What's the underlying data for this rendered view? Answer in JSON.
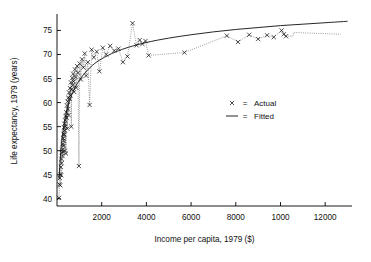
{
  "chart_data": {
    "type": "scatter",
    "title": "",
    "xlabel": "Income per capita, 1979 ($)",
    "ylabel": "Life expectancy, 1979 (years)",
    "xlim": [
      0,
      13200
    ],
    "ylim": [
      38.5,
      78.0
    ],
    "grid": false,
    "xticks": [
      2000,
      4000,
      6000,
      8000,
      10000,
      12000
    ],
    "xticklabels": [
      "2000",
      "4000",
      "6000",
      "8000",
      "1000",
      "12000"
    ],
    "yticks": [
      40,
      45,
      50,
      55,
      60,
      65,
      70,
      75
    ],
    "yticklabels": [
      "40",
      "45",
      "50",
      "55",
      "60",
      "65",
      "70",
      "75"
    ],
    "legend": {
      "position": "center-right-inside",
      "entries": [
        {
          "marker": "x",
          "separator": "=",
          "label": "Actual"
        },
        {
          "marker": "line",
          "separator": "=",
          "label": "Fitted"
        }
      ]
    },
    "series": [
      {
        "name": "Actual",
        "marker": "x",
        "color": "#111111",
        "connector": "dotted",
        "points": [
          [
            90,
            40.2
          ],
          [
            110,
            43.0
          ],
          [
            130,
            44.3
          ],
          [
            145,
            42.8
          ],
          [
            160,
            45.1
          ],
          [
            175,
            46.6
          ],
          [
            185,
            44.9
          ],
          [
            200,
            48.3
          ],
          [
            210,
            47.4
          ],
          [
            220,
            49.6
          ],
          [
            235,
            50.2
          ],
          [
            245,
            48.9
          ],
          [
            255,
            51.4
          ],
          [
            265,
            49.8
          ],
          [
            275,
            52.6
          ],
          [
            285,
            51.0
          ],
          [
            295,
            53.5
          ],
          [
            305,
            52.1
          ],
          [
            315,
            54.8
          ],
          [
            325,
            53.3
          ],
          [
            335,
            55.6
          ],
          [
            345,
            54.2
          ],
          [
            355,
            50.0
          ],
          [
            365,
            56.3
          ],
          [
            375,
            55.1
          ],
          [
            390,
            57.2
          ],
          [
            400,
            49.4
          ],
          [
            415,
            58.0
          ],
          [
            430,
            56.8
          ],
          [
            445,
            59.4
          ],
          [
            460,
            54.6
          ],
          [
            475,
            60.2
          ],
          [
            490,
            58.6
          ],
          [
            505,
            61.0
          ],
          [
            520,
            57.4
          ],
          [
            540,
            62.1
          ],
          [
            560,
            60.8
          ],
          [
            580,
            63.0
          ],
          [
            600,
            61.5
          ],
          [
            620,
            64.2
          ],
          [
            640,
            55.0
          ],
          [
            660,
            62.8
          ],
          [
            680,
            65.1
          ],
          [
            700,
            63.6
          ],
          [
            720,
            66.0
          ],
          [
            745,
            64.4
          ],
          [
            770,
            62.2
          ],
          [
            800,
            66.9
          ],
          [
            830,
            65.3
          ],
          [
            860,
            63.1
          ],
          [
            900,
            67.6
          ],
          [
            940,
            66.2
          ],
          [
            980,
            46.8
          ],
          [
            1020,
            68.1
          ],
          [
            1070,
            64.8
          ],
          [
            1120,
            69.0
          ],
          [
            1180,
            67.3
          ],
          [
            1240,
            70.2
          ],
          [
            1300,
            65.6
          ],
          [
            1380,
            68.4
          ],
          [
            1460,
            59.5
          ],
          [
            1550,
            71.0
          ],
          [
            1650,
            69.4
          ],
          [
            1780,
            70.6
          ],
          [
            1900,
            66.5
          ],
          [
            2050,
            71.4
          ],
          [
            2200,
            70.0
          ],
          [
            2380,
            71.8
          ],
          [
            2560,
            70.8
          ],
          [
            2750,
            71.2
          ],
          [
            2950,
            68.4
          ],
          [
            3150,
            69.6
          ],
          [
            3380,
            76.5
          ],
          [
            3560,
            71.9
          ],
          [
            3700,
            73.0
          ],
          [
            3820,
            72.2
          ],
          [
            3960,
            72.8
          ],
          [
            4100,
            69.8
          ],
          [
            5700,
            70.4
          ],
          [
            7600,
            73.9
          ],
          [
            8100,
            72.6
          ],
          [
            8600,
            74.1
          ],
          [
            9000,
            73.2
          ],
          [
            9400,
            74.0
          ],
          [
            9700,
            73.6
          ],
          [
            10050,
            75.0
          ],
          [
            10150,
            74.2
          ],
          [
            10250,
            73.8
          ]
        ]
      },
      {
        "name": "Fitted",
        "marker": "line",
        "color": "#1a1a1a",
        "model": "logarithmic",
        "points": [
          [
            90,
            44.2
          ],
          [
            200,
            51.5
          ],
          [
            350,
            56.4
          ],
          [
            500,
            59.4
          ],
          [
            700,
            62.1
          ],
          [
            900,
            63.9
          ],
          [
            1200,
            65.9
          ],
          [
            1600,
            67.8
          ],
          [
            2000,
            69.1
          ],
          [
            2600,
            70.5
          ],
          [
            3200,
            71.5
          ],
          [
            4000,
            72.5
          ],
          [
            5000,
            73.4
          ],
          [
            6000,
            74.1
          ],
          [
            7000,
            74.7
          ],
          [
            8000,
            75.2
          ],
          [
            9000,
            75.6
          ],
          [
            10000,
            76.0
          ],
          [
            11000,
            76.3
          ],
          [
            12000,
            76.6
          ],
          [
            13000,
            76.9
          ]
        ]
      },
      {
        "name": "Actual-tail-step",
        "marker": "line",
        "color": "#4a4a4a",
        "connector": "dotted",
        "points": [
          [
            10250,
            73.8
          ],
          [
            10550,
            73.8
          ],
          [
            10600,
            74.6
          ],
          [
            11000,
            74.5
          ],
          [
            11600,
            74.4
          ],
          [
            12200,
            74.3
          ],
          [
            12700,
            74.2
          ]
        ]
      }
    ]
  }
}
